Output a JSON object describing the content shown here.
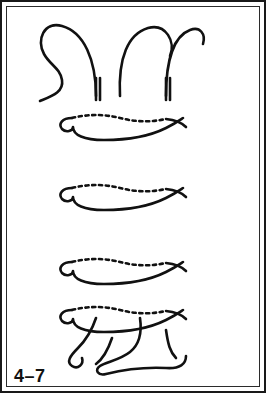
{
  "figure": {
    "caption": "4–7",
    "background_color": "#ffffff",
    "frame_color": "#191919",
    "width": 266,
    "height": 393
  },
  "palette": {
    "thread_color": "#111111",
    "bead_outline": "#3a3a3a",
    "bead_light": "#e2e2e2",
    "bead_mid_light": "#d6d6d6",
    "bead_mid": "#c4c4c4",
    "bead_pale": "#ececec",
    "bead_dark": "#3a3a3a",
    "bead_dark2": "#444444",
    "number_on_light": "#2b2b2b",
    "number_on_dark": "#d8d8d8"
  },
  "columns": [
    {
      "name": "left-column",
      "center_x": 96,
      "beads": [
        {
          "index": 1,
          "label": "",
          "fill": "#dedede",
          "cy": 92
        },
        {
          "index": 2,
          "label": "",
          "fill": "#c8c8c8",
          "cy": 117
        },
        {
          "index": 3,
          "label": "",
          "fill": "#c2c2c2",
          "cy": 141
        },
        {
          "index": 4,
          "label": "",
          "fill": "#dcdcdc",
          "cy": 164
        },
        {
          "index": 5,
          "label": "",
          "fill": "#e6e6e6",
          "cy": 187
        },
        {
          "index": 6,
          "label": "",
          "fill": "#d4d4d4",
          "cy": 211
        },
        {
          "index": 7,
          "label": "",
          "fill": "#dadada",
          "cy": 234
        },
        {
          "index": 8,
          "label": "",
          "fill": "#e4e4e4",
          "cy": 258
        },
        {
          "index": 9,
          "label": "",
          "fill": "#cacaca",
          "cy": 281
        },
        {
          "index": 10,
          "label": "",
          "fill": "#d2d2d2",
          "cy": 305
        },
        {
          "index": 11,
          "label": "",
          "fill": "#dcdcdc",
          "cy": 330
        }
      ]
    },
    {
      "name": "right-column",
      "center_x": 166,
      "beads": [
        {
          "index": 1,
          "label": "1",
          "fill": "#dedede",
          "cy": 92
        },
        {
          "index": 2,
          "label": "2",
          "fill": "#c8c8c8",
          "cy": 117
        },
        {
          "index": 3,
          "label": "3",
          "fill": "#c2c2c2",
          "cy": 141
        },
        {
          "index": 4,
          "label": "4",
          "fill": "#e0e0e0",
          "cy": 164
        },
        {
          "index": 5,
          "label": "5",
          "fill": "#3a3a3a",
          "cy": 187
        },
        {
          "index": 6,
          "label": "6",
          "fill": "#3e3e3e",
          "cy": 211
        },
        {
          "index": 7,
          "label": "7",
          "fill": "#343434",
          "cy": 234
        },
        {
          "index": 8,
          "label": "8",
          "fill": "#e6e6e6",
          "cy": 258
        },
        {
          "index": 9,
          "label": "9",
          "fill": "#d0d0d0",
          "cy": 281
        },
        {
          "index": 10,
          "label": "10",
          "fill": "#d8d8d8",
          "cy": 305
        },
        {
          "index": 11,
          "label": "11",
          "fill": "#dedede",
          "cy": 330
        }
      ]
    }
  ],
  "threads": {
    "wrap_rows": [
      {
        "name": "wrap-row-1",
        "cy": 121
      },
      {
        "name": "wrap-row-2",
        "cy": 191
      },
      {
        "name": "wrap-row-3",
        "cy": 265
      },
      {
        "name": "wrap-row-4",
        "cy": 313
      }
    ],
    "description": "Two vertical bead ladders joined by four horizontal thread wraps; needle threads exit the tops of both columns in long loops, with a free tail at upper left and crossing returns at the bottom."
  }
}
